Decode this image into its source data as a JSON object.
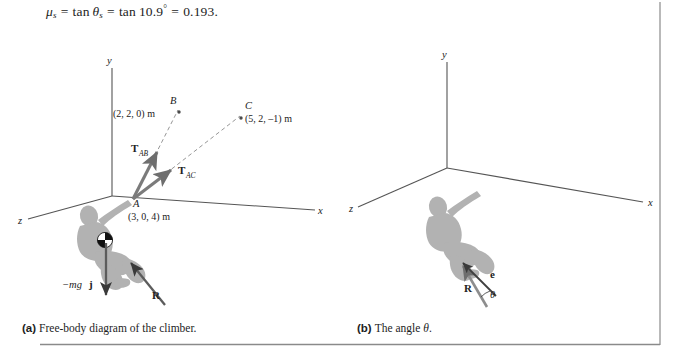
{
  "equation": {
    "mu_symbol": "μ",
    "mu_sub": "s",
    "eq1": "=",
    "tan1": "tan",
    "theta_symbol": "θ",
    "theta_sub": "s",
    "eq2": "=",
    "tan2": "tan",
    "angle_value": "10.9",
    "degree": "°",
    "eq3": "=",
    "result": "0.193.",
    "full_text": "μs = tan θs = tan 10.9° = 0.193."
  },
  "panel_a": {
    "caption_tag": "(a)",
    "caption_text": "Free-body diagram of the climber.",
    "axes": {
      "x_label": "x",
      "y_label": "y",
      "z_label": "z"
    },
    "points": [
      {
        "name": "B",
        "coords": "(2, 2, 0) m"
      },
      {
        "name": "C",
        "coords": "(5, 2, –1) m"
      },
      {
        "name": "A",
        "coords": "(3, 0, 4) m"
      }
    ],
    "vectors": [
      {
        "symbol": "T",
        "subscript": "AB"
      },
      {
        "symbol": "T",
        "subscript": "AC"
      },
      {
        "symbol": "R",
        "subscript": ""
      }
    ],
    "weight_label": {
      "prefix": "−mg",
      "unit_vector": "j"
    }
  },
  "panel_b": {
    "caption_tag": "(b)",
    "caption_text_pre": "The angle ",
    "caption_theta": "θ",
    "caption_text_post": ".",
    "axes": {
      "x_label": "x",
      "y_label": "y",
      "z_label": "z"
    },
    "vectors": [
      {
        "symbol": "R"
      },
      {
        "symbol": "e"
      }
    ],
    "angle_label": "θ"
  },
  "colors": {
    "ink": "#232323",
    "axis_line": "#555555",
    "climber_fill": "#b0b0b0",
    "arrow_gray": "#6e6e6e",
    "arrow_dark": "#3a3a3a",
    "dashed_line": "#7a7a7a",
    "border": "#8a8a8a",
    "background": "#ffffff"
  }
}
